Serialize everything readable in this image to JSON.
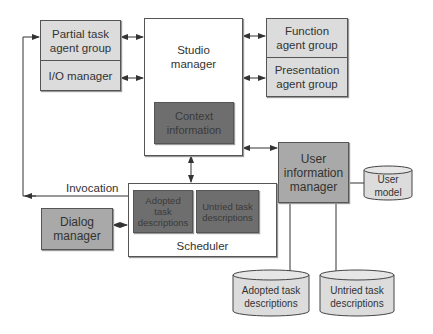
{
  "diagram": {
    "nodes": {
      "partial_task": "Partial task agent group",
      "io_manager": "I/O manager",
      "studio_manager": "Studio manager",
      "context_information": "Context information",
      "function_agent": "Function agent group",
      "presentation_agent": "Presentation agent group",
      "user_info_manager": "User information manager",
      "user_model": "User model",
      "scheduler": "Scheduler",
      "scheduler_adopted": "Adopted task descriptions",
      "scheduler_untried": "Untried task descriptions",
      "dialog_manager": "Dialog manager",
      "db_adopted": "Adopted task descriptions",
      "db_untried": "Untried task descriptions"
    },
    "edge_labels": {
      "invocation": "Invocation"
    },
    "colors": {
      "light_box": "#dcdcdc",
      "mid_box": "#a9a9a9",
      "dark_box": "#6e6e6e",
      "line": "#444444"
    }
  }
}
